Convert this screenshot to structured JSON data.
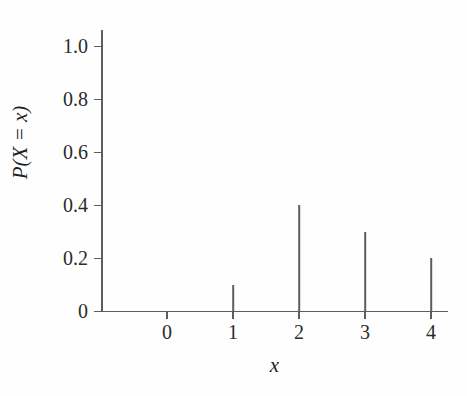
{
  "chart_data": {
    "type": "bar",
    "title": "",
    "subtitle": "",
    "xlabel": "x",
    "ylabel": "P(X = x)",
    "categories": [
      "0",
      "1",
      "2",
      "3",
      "4"
    ],
    "x": [
      0,
      1,
      2,
      3,
      4
    ],
    "values": [
      0,
      0.1,
      0.4,
      0.3,
      0.2
    ],
    "xlim": [
      -0.55,
      4.26
    ],
    "ylim": [
      0,
      1.06
    ],
    "xticks": [
      "0",
      "1",
      "2",
      "3",
      "4"
    ],
    "yticks": [
      "0",
      "0.2",
      "0.4",
      "0.6",
      "0.8",
      "1.0"
    ],
    "ytick_values": [
      0,
      0.2,
      0.4,
      0.6,
      0.8,
      1.0
    ],
    "grid": false,
    "legend": false,
    "legend_position": "none",
    "annotations": [],
    "style": "stem-plot",
    "colors": {
      "line": "#5d5d5d",
      "text": "#2b2b2b",
      "background": "#fefefe"
    }
  },
  "axes": {
    "y": {
      "label": "P(X = x)",
      "ticks": [
        {
          "label": "1.0",
          "value": 1.0
        },
        {
          "label": "0.8",
          "value": 0.8
        },
        {
          "label": "0.6",
          "value": 0.6
        },
        {
          "label": "0.4",
          "value": 0.4
        },
        {
          "label": "0.2",
          "value": 0.2
        },
        {
          "label": "0",
          "value": 0
        }
      ]
    },
    "x": {
      "label": "x",
      "ticks": [
        {
          "label": "0",
          "value": 0
        },
        {
          "label": "1",
          "value": 1
        },
        {
          "label": "2",
          "value": 2
        },
        {
          "label": "3",
          "value": 3
        },
        {
          "label": "4",
          "value": 4
        }
      ]
    }
  },
  "stems": [
    {
      "label": "0",
      "value": 0
    },
    {
      "label": "1",
      "value": 0.1
    },
    {
      "label": "2",
      "value": 0.4
    },
    {
      "label": "3",
      "value": 0.3
    },
    {
      "label": "4",
      "value": 0.2
    }
  ]
}
